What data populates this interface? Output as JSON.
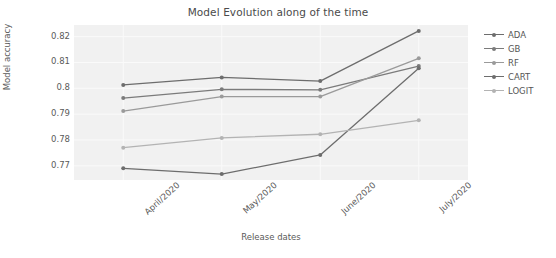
{
  "chart_data": {
    "type": "line",
    "title": "Model Evolution along of the time",
    "xlabel": "Release dates",
    "ylabel": "Model accuracy",
    "categories": [
      "April/2020",
      "May/2020",
      "June/2020",
      "July/2020"
    ],
    "yticks": [
      "0.82",
      "0.81",
      "0.8",
      "0.79",
      "0.78",
      "0.77"
    ],
    "ytick_values": [
      0.82,
      0.81,
      0.8,
      0.79,
      0.78,
      0.77
    ],
    "ylim": [
      0.7645,
      0.8245
    ],
    "grid": true,
    "legend_position": "right",
    "series": [
      {
        "name": "ADA",
        "color": "#6d6d6d",
        "values": [
          0.8013,
          0.8042,
          0.8028,
          0.8222
        ]
      },
      {
        "name": "GB",
        "color": "#7b7b7b",
        "values": [
          0.7962,
          0.7996,
          0.7994,
          0.8086
        ]
      },
      {
        "name": "RF",
        "color": "#9a9a9a",
        "values": [
          0.7912,
          0.7968,
          0.7968,
          0.8116
        ]
      },
      {
        "name": "CART",
        "color": "#6d6d6d",
        "values": [
          0.769,
          0.7668,
          0.7742,
          0.8078
        ]
      },
      {
        "name": "LOGIT",
        "color": "#b3b3b3",
        "values": [
          0.777,
          0.7808,
          0.7822,
          0.7876
        ]
      }
    ]
  },
  "figure": {
    "plot_background": "#f1f1f1",
    "gridline_color": "#fafafa",
    "page_background": "#ffffff"
  }
}
